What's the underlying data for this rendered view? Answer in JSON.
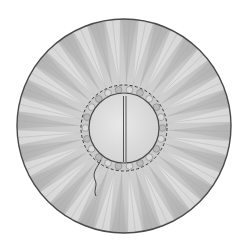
{
  "illustration": {
    "subject": "Gathered fabric circle (yo-yo) with running-stitch gathering and center slit",
    "colors": {
      "background": "#ffffff",
      "fabric_base": "#c9c9c9",
      "fabric_light": "#ececec",
      "fabric_dark": "#9a9a9a",
      "center_fill": "#dedede",
      "outline": "#4a4a4a",
      "stitch": "#3a3a3a",
      "thread": "#444444"
    },
    "outer_circle": {
      "cx": 124,
      "cy": 126,
      "r": 107
    },
    "stitch_ring": {
      "cx": 124,
      "cy": 128,
      "r": 43
    },
    "inner_circle": {
      "cx": 124,
      "cy": 128,
      "r": 35
    },
    "slit": {
      "x": 124.5,
      "y1": 96,
      "y2": 162
    },
    "pleat_count": 40
  }
}
